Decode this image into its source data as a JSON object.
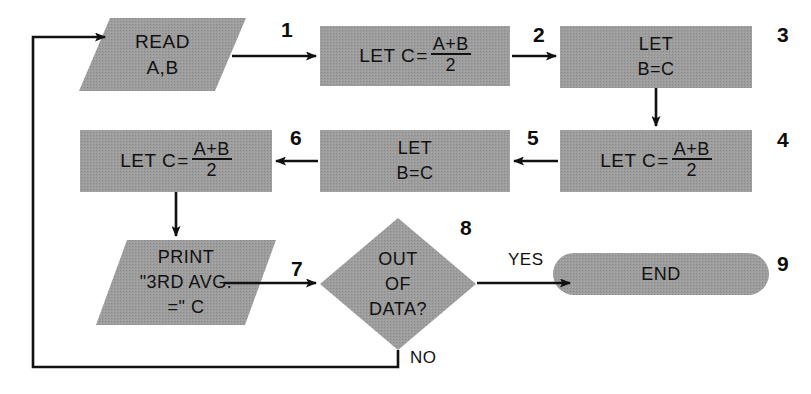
{
  "diagram": {
    "fill_color": "#9d9d9d",
    "line_color": "#111111",
    "background": "#ffffff"
  },
  "nodes": [
    {
      "id": "read",
      "shape": "parallelogram",
      "step": "1",
      "lines": [
        "READ",
        "A,B"
      ]
    },
    {
      "id": "let-c-1",
      "shape": "rectangle",
      "step": "2",
      "prefix": "LET  C",
      "equals": "=",
      "numerator": "A+B",
      "denominator": "2"
    },
    {
      "id": "let-b-c-1",
      "shape": "rectangle",
      "step": "3",
      "lines": [
        "LET",
        "B=C"
      ]
    },
    {
      "id": "let-c-2",
      "shape": "rectangle",
      "step": "4",
      "prefix": "LET  C",
      "equals": "=",
      "numerator": "A+B",
      "denominator": "2"
    },
    {
      "id": "let-b-c-2",
      "shape": "rectangle",
      "step": "5",
      "lines": [
        "LET",
        "B=C"
      ]
    },
    {
      "id": "let-c-3",
      "shape": "rectangle",
      "step": "6",
      "prefix": "LET  C",
      "equals": "=",
      "numerator": "A+B",
      "denominator": "2"
    },
    {
      "id": "print",
      "shape": "parallelogram",
      "step": "7",
      "lines": [
        "PRINT",
        "\"3RD AVG.",
        "=\" C"
      ]
    },
    {
      "id": "decision",
      "shape": "diamond",
      "step": "8",
      "lines": [
        "OUT",
        "OF",
        "DATA?"
      ]
    },
    {
      "id": "end",
      "shape": "stadium",
      "step": "9",
      "lines": [
        "END"
      ]
    }
  ],
  "edge_labels": {
    "yes": "YES",
    "no": "NO"
  }
}
